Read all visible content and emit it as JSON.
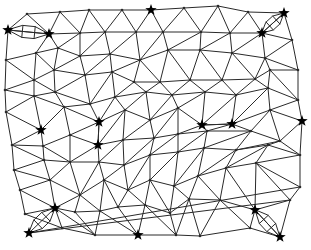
{
  "diagram": {
    "type": "triangulated-mesh",
    "width": 311,
    "height": 250,
    "colors": {
      "edge": "#2a2a2a",
      "node": "#2a2a2a",
      "star": "#000000",
      "background": "#ffffff"
    },
    "nodes": [
      [
        8,
        30
      ],
      [
        27,
        14
      ],
      [
        60,
        12
      ],
      [
        89,
        10
      ],
      [
        122,
        10
      ],
      [
        151,
        10
      ],
      [
        184,
        8
      ],
      [
        218,
        6
      ],
      [
        248,
        12
      ],
      [
        284,
        13
      ],
      [
        49,
        34
      ],
      [
        80,
        33
      ],
      [
        105,
        32
      ],
      [
        136,
        32
      ],
      [
        163,
        32
      ],
      [
        201,
        32
      ],
      [
        230,
        33
      ],
      [
        262,
        33
      ],
      [
        292,
        40
      ],
      [
        6,
        60
      ],
      [
        36,
        53
      ],
      [
        58,
        48
      ],
      [
        80,
        56
      ],
      [
        110,
        54
      ],
      [
        140,
        60
      ],
      [
        168,
        50
      ],
      [
        200,
        50
      ],
      [
        232,
        53
      ],
      [
        265,
        58
      ],
      [
        298,
        70
      ],
      [
        5,
        90
      ],
      [
        34,
        80
      ],
      [
        54,
        70
      ],
      [
        85,
        75
      ],
      [
        112,
        72
      ],
      [
        134,
        82
      ],
      [
        160,
        82
      ],
      [
        190,
        80
      ],
      [
        222,
        80
      ],
      [
        255,
        79
      ],
      [
        270,
        70
      ],
      [
        298,
        100
      ],
      [
        6,
        112
      ],
      [
        34,
        96
      ],
      [
        55,
        92
      ],
      [
        90,
        104
      ],
      [
        115,
        97
      ],
      [
        146,
        92
      ],
      [
        172,
        95
      ],
      [
        205,
        92
      ],
      [
        236,
        95
      ],
      [
        268,
        88
      ],
      [
        41,
        130
      ],
      [
        64,
        107
      ],
      [
        99,
        122
      ],
      [
        125,
        110
      ],
      [
        150,
        120
      ],
      [
        178,
        108
      ],
      [
        202,
        125
      ],
      [
        232,
        124
      ],
      [
        270,
        110
      ],
      [
        302,
        121
      ],
      [
        12,
        145
      ],
      [
        43,
        146
      ],
      [
        70,
        135
      ],
      [
        98,
        145
      ],
      [
        123,
        140
      ],
      [
        154,
        138
      ],
      [
        178,
        134
      ],
      [
        207,
        131
      ],
      [
        251,
        131
      ],
      [
        280,
        141
      ],
      [
        14,
        170
      ],
      [
        44,
        160
      ],
      [
        70,
        162
      ],
      [
        99,
        162
      ],
      [
        124,
        165
      ],
      [
        150,
        155
      ],
      [
        178,
        152
      ],
      [
        204,
        148
      ],
      [
        236,
        150
      ],
      [
        268,
        145
      ],
      [
        300,
        155
      ],
      [
        20,
        190
      ],
      [
        50,
        180
      ],
      [
        80,
        195
      ],
      [
        104,
        180
      ],
      [
        128,
        190
      ],
      [
        150,
        180
      ],
      [
        174,
        186
      ],
      [
        198,
        176
      ],
      [
        226,
        168
      ],
      [
        256,
        163
      ],
      [
        300,
        187
      ],
      [
        25,
        214
      ],
      [
        55,
        208
      ],
      [
        75,
        212
      ],
      [
        100,
        211
      ],
      [
        118,
        207
      ],
      [
        145,
        205
      ],
      [
        170,
        213
      ],
      [
        189,
        199
      ],
      [
        220,
        200
      ],
      [
        255,
        210
      ],
      [
        290,
        200
      ],
      [
        29,
        233
      ],
      [
        62,
        228
      ],
      [
        95,
        235
      ],
      [
        138,
        235
      ],
      [
        176,
        235
      ],
      [
        200,
        236
      ],
      [
        250,
        228
      ],
      [
        280,
        237
      ]
    ],
    "edges": [
      [
        0,
        1
      ],
      [
        1,
        2
      ],
      [
        2,
        3
      ],
      [
        3,
        4
      ],
      [
        4,
        5
      ],
      [
        5,
        6
      ],
      [
        6,
        7
      ],
      [
        7,
        8
      ],
      [
        8,
        9
      ],
      [
        0,
        10
      ],
      [
        10,
        11
      ],
      [
        11,
        12
      ],
      [
        12,
        13
      ],
      [
        13,
        14
      ],
      [
        14,
        15
      ],
      [
        15,
        16
      ],
      [
        16,
        17
      ],
      [
        9,
        17
      ],
      [
        9,
        18
      ],
      [
        17,
        18
      ],
      [
        1,
        10
      ],
      [
        2,
        10
      ],
      [
        2,
        11
      ],
      [
        3,
        11
      ],
      [
        3,
        12
      ],
      [
        4,
        12
      ],
      [
        4,
        13
      ],
      [
        5,
        13
      ],
      [
        5,
        14
      ],
      [
        6,
        14
      ],
      [
        6,
        15
      ],
      [
        7,
        15
      ],
      [
        7,
        16
      ],
      [
        8,
        16
      ],
      [
        8,
        17
      ],
      [
        0,
        19
      ],
      [
        19,
        20
      ],
      [
        20,
        21
      ],
      [
        21,
        22
      ],
      [
        22,
        23
      ],
      [
        23,
        24
      ],
      [
        24,
        25
      ],
      [
        25,
        26
      ],
      [
        26,
        27
      ],
      [
        27,
        28
      ],
      [
        28,
        29
      ],
      [
        18,
        29
      ],
      [
        10,
        20
      ],
      [
        10,
        21
      ],
      [
        11,
        21
      ],
      [
        11,
        22
      ],
      [
        12,
        22
      ],
      [
        12,
        23
      ],
      [
        13,
        23
      ],
      [
        13,
        24
      ],
      [
        14,
        24
      ],
      [
        14,
        25
      ],
      [
        15,
        25
      ],
      [
        15,
        26
      ],
      [
        16,
        26
      ],
      [
        16,
        27
      ],
      [
        17,
        27
      ],
      [
        17,
        28
      ],
      [
        18,
        28
      ],
      [
        19,
        30
      ],
      [
        19,
        31
      ],
      [
        20,
        31
      ],
      [
        20,
        32
      ],
      [
        21,
        32
      ],
      [
        22,
        32
      ],
      [
        22,
        33
      ],
      [
        23,
        33
      ],
      [
        23,
        34
      ],
      [
        24,
        34
      ],
      [
        24,
        35
      ],
      [
        24,
        36
      ],
      [
        25,
        36
      ],
      [
        25,
        37
      ],
      [
        26,
        37
      ],
      [
        26,
        38
      ],
      [
        27,
        38
      ],
      [
        27,
        39
      ],
      [
        28,
        39
      ],
      [
        28,
        40
      ],
      [
        29,
        40
      ],
      [
        29,
        41
      ],
      [
        30,
        31
      ],
      [
        31,
        32
      ],
      [
        32,
        33
      ],
      [
        33,
        34
      ],
      [
        34,
        35
      ],
      [
        35,
        36
      ],
      [
        36,
        37
      ],
      [
        37,
        38
      ],
      [
        38,
        39
      ],
      [
        39,
        40
      ],
      [
        40,
        41
      ],
      [
        30,
        42
      ],
      [
        30,
        43
      ],
      [
        31,
        43
      ],
      [
        31,
        44
      ],
      [
        32,
        44
      ],
      [
        33,
        44
      ],
      [
        33,
        45
      ],
      [
        34,
        45
      ],
      [
        34,
        46
      ],
      [
        35,
        46
      ],
      [
        35,
        47
      ],
      [
        36,
        47
      ],
      [
        36,
        48
      ],
      [
        37,
        48
      ],
      [
        37,
        49
      ],
      [
        38,
        49
      ],
      [
        38,
        50
      ],
      [
        39,
        50
      ],
      [
        39,
        51
      ],
      [
        40,
        51
      ],
      [
        41,
        51
      ],
      [
        42,
        43
      ],
      [
        43,
        44
      ],
      [
        44,
        45
      ],
      [
        45,
        46
      ],
      [
        46,
        47
      ],
      [
        47,
        48
      ],
      [
        48,
        49
      ],
      [
        49,
        50
      ],
      [
        50,
        51
      ],
      [
        41,
        61
      ],
      [
        42,
        52
      ],
      [
        43,
        52
      ],
      [
        43,
        53
      ],
      [
        44,
        53
      ],
      [
        45,
        53
      ],
      [
        45,
        54
      ],
      [
        46,
        54
      ],
      [
        46,
        55
      ],
      [
        47,
        55
      ],
      [
        47,
        56
      ],
      [
        48,
        56
      ],
      [
        48,
        57
      ],
      [
        49,
        57
      ],
      [
        49,
        58
      ],
      [
        50,
        58
      ],
      [
        50,
        59
      ],
      [
        51,
        59
      ],
      [
        51,
        60
      ],
      [
        41,
        60
      ],
      [
        52,
        53
      ],
      [
        53,
        54
      ],
      [
        54,
        55
      ],
      [
        55,
        56
      ],
      [
        56,
        57
      ],
      [
        57,
        58
      ],
      [
        58,
        59
      ],
      [
        59,
        60
      ],
      [
        60,
        61
      ],
      [
        42,
        62
      ],
      [
        52,
        62
      ],
      [
        52,
        63
      ],
      [
        53,
        64
      ],
      [
        54,
        64
      ],
      [
        54,
        65
      ],
      [
        55,
        65
      ],
      [
        55,
        66
      ],
      [
        56,
        66
      ],
      [
        56,
        67
      ],
      [
        57,
        67
      ],
      [
        57,
        68
      ],
      [
        58,
        68
      ],
      [
        58,
        69
      ],
      [
        59,
        69
      ],
      [
        59,
        70
      ],
      [
        60,
        70
      ],
      [
        60,
        71
      ],
      [
        61,
        71
      ],
      [
        62,
        63
      ],
      [
        63,
        64
      ],
      [
        64,
        65
      ],
      [
        65,
        66
      ],
      [
        66,
        67
      ],
      [
        67,
        68
      ],
      [
        68,
        69
      ],
      [
        69,
        70
      ],
      [
        70,
        71
      ],
      [
        61,
        82
      ],
      [
        62,
        72
      ],
      [
        62,
        73
      ],
      [
        63,
        73
      ],
      [
        63,
        74
      ],
      [
        64,
        74
      ],
      [
        65,
        74
      ],
      [
        65,
        75
      ],
      [
        66,
        75
      ],
      [
        66,
        76
      ],
      [
        67,
        76
      ],
      [
        67,
        77
      ],
      [
        68,
        77
      ],
      [
        68,
        78
      ],
      [
        69,
        78
      ],
      [
        69,
        79
      ],
      [
        70,
        79
      ],
      [
        70,
        80
      ],
      [
        71,
        80
      ],
      [
        71,
        81
      ],
      [
        71,
        82
      ],
      [
        72,
        73
      ],
      [
        73,
        74
      ],
      [
        74,
        75
      ],
      [
        75,
        76
      ],
      [
        76,
        77
      ],
      [
        77,
        78
      ],
      [
        78,
        79
      ],
      [
        79,
        80
      ],
      [
        80,
        81
      ],
      [
        81,
        82
      ],
      [
        72,
        83
      ],
      [
        72,
        84
      ],
      [
        73,
        84
      ],
      [
        74,
        84
      ],
      [
        74,
        85
      ],
      [
        75,
        85
      ],
      [
        75,
        86
      ],
      [
        76,
        86
      ],
      [
        76,
        87
      ],
      [
        77,
        87
      ],
      [
        77,
        88
      ],
      [
        78,
        88
      ],
      [
        78,
        89
      ],
      [
        79,
        89
      ],
      [
        79,
        90
      ],
      [
        80,
        90
      ],
      [
        80,
        91
      ],
      [
        81,
        91
      ],
      [
        81,
        92
      ],
      [
        82,
        92
      ],
      [
        82,
        93
      ],
      [
        83,
        84
      ],
      [
        84,
        85
      ],
      [
        85,
        86
      ],
      [
        86,
        87
      ],
      [
        87,
        88
      ],
      [
        88,
        89
      ],
      [
        89,
        90
      ],
      [
        90,
        91
      ],
      [
        91,
        92
      ],
      [
        92,
        93
      ],
      [
        83,
        94
      ],
      [
        83,
        95
      ],
      [
        84,
        95
      ],
      [
        85,
        95
      ],
      [
        85,
        96
      ],
      [
        85,
        97
      ],
      [
        86,
        97
      ],
      [
        86,
        98
      ],
      [
        87,
        98
      ],
      [
        87,
        99
      ],
      [
        88,
        99
      ],
      [
        88,
        100
      ],
      [
        89,
        100
      ],
      [
        89,
        101
      ],
      [
        90,
        101
      ],
      [
        90,
        102
      ],
      [
        91,
        102
      ],
      [
        91,
        103
      ],
      [
        92,
        103
      ],
      [
        92,
        104
      ],
      [
        93,
        104
      ],
      [
        93,
        105
      ],
      [
        94,
        95
      ],
      [
        95,
        96
      ],
      [
        96,
        97
      ],
      [
        97,
        98
      ],
      [
        98,
        99
      ],
      [
        99,
        100
      ],
      [
        100,
        101
      ],
      [
        101,
        102
      ],
      [
        102,
        103
      ],
      [
        103,
        104
      ],
      [
        104,
        105
      ],
      [
        94,
        106
      ],
      [
        95,
        106
      ],
      [
        95,
        107
      ],
      [
        96,
        107
      ],
      [
        97,
        107
      ],
      [
        97,
        108
      ],
      [
        98,
        108
      ],
      [
        99,
        108
      ],
      [
        99,
        109
      ],
      [
        100,
        109
      ],
      [
        101,
        109
      ],
      [
        101,
        110
      ],
      [
        102,
        110
      ],
      [
        102,
        111
      ],
      [
        103,
        111
      ],
      [
        103,
        112
      ],
      [
        104,
        112
      ],
      [
        104,
        113
      ],
      [
        105,
        113
      ],
      [
        106,
        107
      ],
      [
        107,
        108
      ],
      [
        108,
        109
      ],
      [
        109,
        110
      ],
      [
        110,
        111
      ],
      [
        111,
        112
      ],
      [
        112,
        113
      ]
    ],
    "lens_links": [
      {
        "from": [
          8,
          30
        ],
        "to": [
          49,
          34
        ]
      },
      {
        "from": [
          262,
          33
        ],
        "to": [
          284,
          13
        ]
      },
      {
        "from": [
          29,
          233
        ],
        "to": [
          55,
          208
        ]
      },
      {
        "from": [
          255,
          210
        ],
        "to": [
          280,
          237
        ]
      }
    ],
    "stars": [
      [
        8,
        30
      ],
      [
        49,
        34
      ],
      [
        151,
        10
      ],
      [
        284,
        13
      ],
      [
        262,
        33
      ],
      [
        41,
        130
      ],
      [
        99,
        122
      ],
      [
        98,
        145
      ],
      [
        202,
        125
      ],
      [
        232,
        124
      ],
      [
        302,
        121
      ],
      [
        55,
        208
      ],
      [
        29,
        233
      ],
      [
        138,
        235
      ],
      [
        255,
        210
      ],
      [
        280,
        237
      ]
    ],
    "star_links": [
      {
        "from": [
          99,
          122
        ],
        "to": [
          98,
          145
        ]
      },
      {
        "from": [
          202,
          125
        ],
        "to": [
          232,
          124
        ]
      }
    ]
  }
}
